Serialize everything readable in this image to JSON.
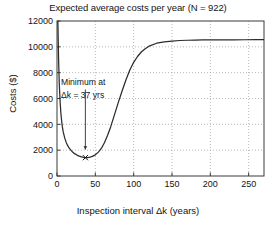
{
  "chart_data": {
    "type": "line",
    "title": "Expected average costs per year (N = 922)",
    "xlabel": "Inspection interval Δk (years)",
    "ylabel": "Costs ($)",
    "xlim": [
      0,
      270
    ],
    "ylim": [
      0,
      12000
    ],
    "grid": true,
    "legend_position": "none",
    "xticks": [
      0,
      50,
      100,
      150,
      200,
      250
    ],
    "xtick_labels": [
      "0",
      "50",
      "100",
      "150",
      "200",
      "250"
    ],
    "yticks": [
      0,
      2000,
      4000,
      6000,
      8000,
      10000,
      12000
    ],
    "ytick_labels": [
      "0",
      "2000",
      "4000",
      "6000",
      "8000",
      "10000",
      "12000"
    ],
    "series": [
      {
        "name": "Expected average costs per year",
        "color": "#2b2b2b",
        "x": [
          1,
          2,
          3,
          4,
          5,
          6,
          7,
          8,
          10,
          12,
          14,
          16,
          18,
          20,
          23,
          26,
          29,
          32,
          35,
          37,
          40,
          43,
          46,
          50,
          54,
          58,
          62,
          66,
          70,
          75,
          80,
          85,
          90,
          95,
          100,
          105,
          110,
          115,
          120,
          130,
          140,
          150,
          160,
          170,
          180,
          190,
          200,
          215,
          230,
          245,
          260,
          270
        ],
        "y": [
          12400,
          9200,
          7100,
          5800,
          4900,
          4300,
          3800,
          3450,
          2950,
          2600,
          2350,
          2150,
          2000,
          1880,
          1730,
          1620,
          1540,
          1480,
          1440,
          1420,
          1430,
          1460,
          1520,
          1640,
          1850,
          2150,
          2600,
          3150,
          3800,
          4750,
          5700,
          6600,
          7450,
          8200,
          8800,
          9250,
          9600,
          9850,
          10050,
          10280,
          10390,
          10450,
          10490,
          10510,
          10520,
          10530,
          10535,
          10540,
          10545,
          10548,
          10550,
          10550
        ]
      }
    ],
    "annotations": [
      {
        "name": "minimum-annotation",
        "line1": "Minimum at",
        "line2": "Δk = 37 yrs",
        "arrow_from": [
          37,
          6700
        ],
        "arrow_to": [
          37,
          2050
        ],
        "marker_x": 37,
        "marker_y": 1420,
        "marker_symbol": "x"
      }
    ]
  }
}
